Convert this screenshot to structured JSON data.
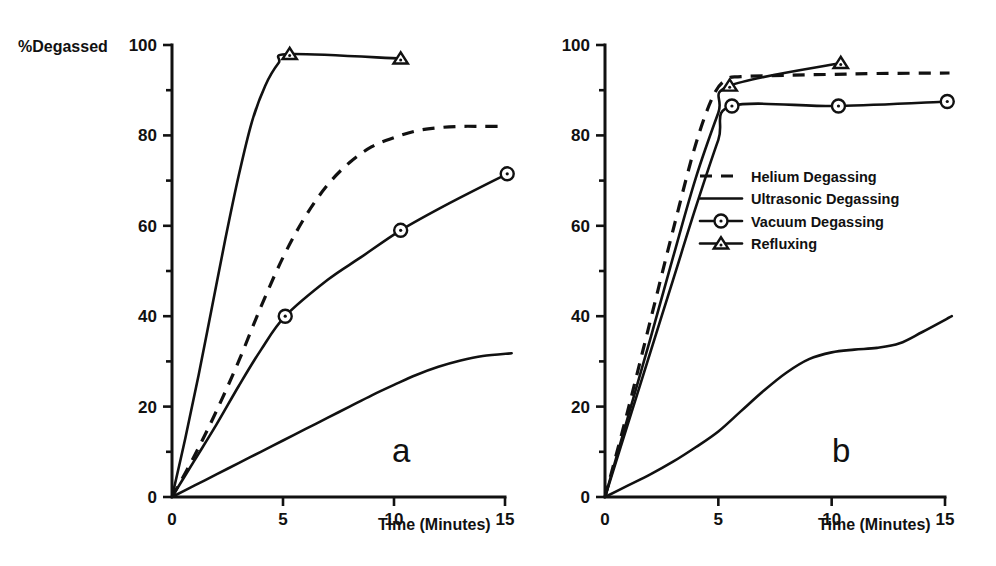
{
  "figure": {
    "ylabel": "%Degassed",
    "xlabel": "Time (Minutes)",
    "panel_a_letter": "a",
    "panel_b_letter": "b",
    "y_ticks": [
      "0",
      "20",
      "40",
      "60",
      "80",
      "100"
    ],
    "x_ticks": [
      "0",
      "5",
      "10",
      "15"
    ]
  },
  "legend": {
    "position": "panel-b-center",
    "items": [
      {
        "label": "Helium Degassing",
        "style": "dashed",
        "marker": "none"
      },
      {
        "label": "Ultrasonic Degassing",
        "style": "solid",
        "marker": "none"
      },
      {
        "label": "Vacuum Degassing",
        "style": "solid",
        "marker": "circle"
      },
      {
        "label": "Refluxing",
        "style": "solid",
        "marker": "triangle"
      }
    ]
  },
  "chart_data": [
    {
      "type": "line",
      "panel": "a",
      "title": "a",
      "xlabel": "Time (Minutes)",
      "ylabel": "%Degassed",
      "xlim": [
        0,
        15.5
      ],
      "ylim": [
        0,
        100
      ],
      "xticks": [
        0,
        5,
        10,
        15
      ],
      "yticks": [
        0,
        20,
        40,
        60,
        80,
        100
      ],
      "grid": false,
      "legend_position": "none",
      "series": [
        {
          "name": "Refluxing",
          "style": "solid",
          "marker": "triangle",
          "x": [
            0,
            0.6,
            1.2,
            1.8,
            2.4,
            3.0,
            3.6,
            4.2,
            4.8,
            5.3,
            10.3
          ],
          "y": [
            0,
            13,
            27,
            42,
            57,
            71,
            83,
            91,
            96,
            98,
            97
          ]
        },
        {
          "name": "Helium Degassing",
          "style": "dashed",
          "marker": "none",
          "x": [
            0,
            1,
            2,
            3,
            4,
            5,
            6,
            7,
            8,
            9,
            10,
            11,
            12,
            13,
            14,
            15
          ],
          "y": [
            0,
            9,
            19,
            30,
            42,
            53,
            62,
            69,
            74,
            77.5,
            79.5,
            81,
            81.7,
            82,
            82,
            82
          ]
        },
        {
          "name": "Vacuum Degassing",
          "style": "solid",
          "marker": "circle",
          "x": [
            0,
            1,
            2,
            3,
            4,
            5.1,
            7,
            8.5,
            10.3,
            12.5,
            15.1
          ],
          "y": [
            0,
            8,
            16,
            24.5,
            32.5,
            40,
            48,
            53,
            59,
            65,
            71.5
          ]
        },
        {
          "name": "Ultrasonic Degassing",
          "style": "solid",
          "marker": "none",
          "x": [
            0,
            1,
            2,
            3,
            4,
            5,
            6,
            7,
            8,
            9,
            10,
            11,
            12,
            13,
            14,
            15.3
          ],
          "y": [
            0,
            2.5,
            5,
            7.5,
            10,
            12.5,
            15,
            17.5,
            20,
            22.5,
            24.8,
            27,
            28.8,
            30.2,
            31.2,
            31.8
          ]
        }
      ]
    },
    {
      "type": "line",
      "panel": "b",
      "title": "b",
      "xlabel": "Time (Minutes)",
      "ylabel": "%Degassed",
      "xlim": [
        0,
        15.5
      ],
      "ylim": [
        0,
        100
      ],
      "xticks": [
        0,
        5,
        10,
        15
      ],
      "yticks": [
        0,
        20,
        40,
        60,
        80,
        100
      ],
      "grid": false,
      "legend_position": "center",
      "series": [
        {
          "name": "Helium Degassing",
          "style": "dashed",
          "marker": "none",
          "x": [
            0,
            1,
            2,
            3,
            4,
            4.8,
            5.4,
            6,
            8,
            10,
            12,
            15.2
          ],
          "y": [
            0,
            19,
            39,
            59,
            78,
            89,
            92.5,
            93,
            93.3,
            93.5,
            93.7,
            93.8
          ]
        },
        {
          "name": "Refluxing",
          "style": "solid",
          "marker": "triangle",
          "x": [
            0,
            1,
            2,
            3,
            4,
            5,
            5.5,
            10.4
          ],
          "y": [
            0,
            17.5,
            35,
            53,
            70.5,
            85,
            91,
            96
          ]
        },
        {
          "name": "Vacuum Degassing",
          "style": "solid",
          "marker": "circle",
          "x": [
            0,
            1,
            2,
            3,
            4,
            5,
            5.6,
            10.3,
            15.1
          ],
          "y": [
            0,
            16,
            32,
            48,
            64,
            79,
            86.5,
            86.5,
            87.5
          ]
        },
        {
          "name": "Ultrasonic Degassing",
          "style": "solid",
          "marker": "none",
          "x": [
            0,
            1,
            2,
            3,
            4,
            5,
            6,
            7,
            8,
            9,
            10,
            11,
            12,
            13,
            14,
            15.3
          ],
          "y": [
            0,
            2.5,
            5,
            7.8,
            11,
            14.5,
            19,
            23.5,
            27.5,
            30.5,
            32,
            32.6,
            33,
            34,
            36.5,
            40
          ]
        }
      ]
    }
  ]
}
